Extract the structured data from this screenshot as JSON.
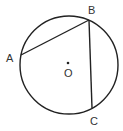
{
  "diagram": {
    "center": {
      "label": "O"
    },
    "points": [
      {
        "label": "A"
      },
      {
        "label": "B"
      },
      {
        "label": "C"
      }
    ],
    "segments": [
      "AB",
      "BC"
    ],
    "colors": {
      "stroke": "#222222",
      "background": "#ffffff"
    }
  }
}
